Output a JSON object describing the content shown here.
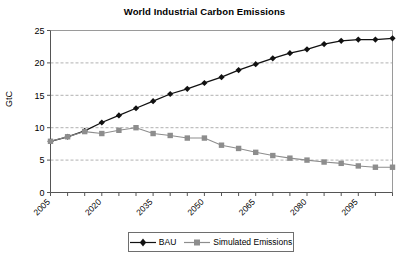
{
  "chart_data": {
    "type": "line",
    "title": "World Industrial Carbon Emissions",
    "xlabel": "",
    "ylabel": "GtC",
    "x": [
      2005,
      2010,
      2015,
      2020,
      2025,
      2030,
      2035,
      2040,
      2045,
      2050,
      2055,
      2060,
      2065,
      2070,
      2075,
      2080,
      2085,
      2090,
      2095,
      2100,
      2105
    ],
    "xlim": [
      2005,
      2105
    ],
    "ylim": [
      0,
      25
    ],
    "yticks": [
      0,
      5,
      10,
      15,
      20,
      25
    ],
    "xticks_labeled": [
      "2005",
      "2020",
      "2035",
      "2050",
      "2065",
      "2080",
      "2095"
    ],
    "xtick_interval_years": 5,
    "xtick_label_interval_years": 15,
    "grid": "horizontal-dashed",
    "legend_position": "bottom-center",
    "series": [
      {
        "name": "BAU",
        "color": "#111111",
        "marker": "diamond",
        "values": [
          7.9,
          8.6,
          9.5,
          10.8,
          11.9,
          13.0,
          14.1,
          15.2,
          16.0,
          16.9,
          17.8,
          18.9,
          19.8,
          20.7,
          21.5,
          22.1,
          22.9,
          23.4,
          23.6,
          23.6,
          23.8
        ]
      },
      {
        "name": "Simulated Emissions",
        "color": "#8d8d8d",
        "marker": "square",
        "values": [
          7.9,
          8.6,
          9.4,
          9.1,
          9.6,
          10.0,
          9.1,
          8.8,
          8.4,
          8.4,
          7.3,
          6.8,
          6.2,
          5.7,
          5.3,
          5.0,
          4.7,
          4.5,
          4.1,
          3.9,
          3.9
        ]
      }
    ]
  },
  "legend": {
    "entries": [
      {
        "label": "BAU"
      },
      {
        "label": "Simulated Emissions"
      }
    ]
  },
  "axis": {
    "y_title": "GtC"
  }
}
